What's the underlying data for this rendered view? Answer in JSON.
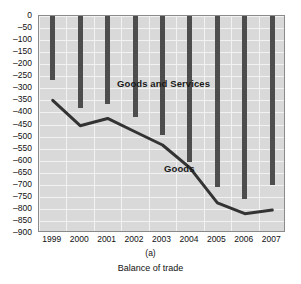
{
  "chart_data": {
    "type": "bar",
    "title": "",
    "xlabel": "",
    "ylabel": "",
    "categories": [
      "1999",
      "2000",
      "2001",
      "2002",
      "2003",
      "2004",
      "2005",
      "2006",
      "2007"
    ],
    "ylim": [
      -900,
      0
    ],
    "ytick_step": 50,
    "grid": true,
    "legend_position": "inline-annotation",
    "series": [
      {
        "name": "Goods and Services",
        "render": "bar",
        "color": "#4d4d4d",
        "values": [
          -265,
          -380,
          -365,
          -420,
          -495,
          -605,
          -710,
          -760,
          -700
        ]
      },
      {
        "name": "Goods",
        "render": "line",
        "color": "#333333",
        "values": [
          -350,
          -455,
          -425,
          -480,
          -535,
          -630,
          -775,
          -820,
          -805
        ]
      }
    ],
    "ytick_labels": [
      "0",
      "–50",
      "–100",
      "–150",
      "–200",
      "–250",
      "–300",
      "–350",
      "–400",
      "–450",
      "–500",
      "–550",
      "–600",
      "–650",
      "–700",
      "–750",
      "–800",
      "–850",
      "–900"
    ],
    "annotations": [
      {
        "text": "Goods and Services",
        "x": 2001,
        "y": -250
      },
      {
        "text": "Goods",
        "x": 2003,
        "y": -590
      }
    ]
  },
  "figure": {
    "panel_label": "(a)",
    "caption": "Balance of trade"
  },
  "colors": {
    "plot_background": "#d9d9d9",
    "gridline": "#f2f2f2",
    "bar": "#4d4d4d",
    "line": "#333333",
    "frame": "#8a8a8a",
    "text": "#111111"
  }
}
